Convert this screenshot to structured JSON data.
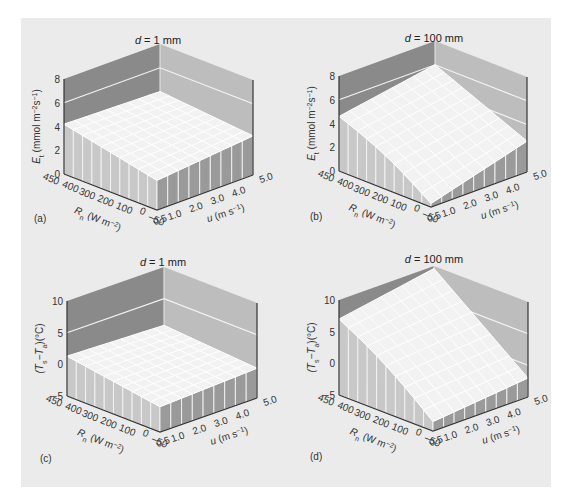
{
  "chart_data": [
    {
      "id": "a",
      "type": "surface3d",
      "panel_label": "(a)",
      "title": "d = 1 mm",
      "title_var": "d",
      "title_rest": " = 1 mm",
      "zlabel": "E_t (mmol m^-2 s^-1)",
      "zlabel_main": "E",
      "zlabel_sub": "t",
      "zlabel_rest": " (mmol m",
      "zlabel_sup1": "−2",
      "zlabel_mid": "s",
      "zlabel_sup2": "−1",
      "zlabel_end": ")",
      "xlabel": "R_n (W m^-2)",
      "ylabel": "u (m s^-1)",
      "zlim": [
        0,
        8
      ],
      "zticks": [
        "0",
        "2",
        "4",
        "6",
        "8"
      ],
      "zgrid_on_walls": [
        6
      ],
      "R_ticks": [
        "450",
        "400",
        "300",
        "200",
        "100",
        "0",
        "−50"
      ],
      "u_ticks": [
        "0.5",
        "1.0",
        "2.0",
        "3.0",
        "4.0",
        "5.0"
      ],
      "corner_values": {
        "R450_u0.5": 4.2,
        "Rneg50_u0.5": 2.5,
        "Rneg50_u5": 3.3,
        "R450_u5": 4.0
      }
    },
    {
      "id": "b",
      "type": "surface3d",
      "panel_label": "(b)",
      "title": "d = 100 mm",
      "title_var": "d",
      "title_rest": " = 100 mm",
      "zlabel": "E_t (mmol m^-2 s^-1)",
      "zlabel_main": "E",
      "zlabel_sub": "t",
      "zlabel_rest": " (mmol m",
      "zlabel_sup1": "−2",
      "zlabel_mid": "s",
      "zlabel_sup2": "−1",
      "zlabel_end": ")",
      "xlabel": "R_n (W m^-2)",
      "ylabel": "u (m s^-1)",
      "zlim": [
        0,
        8
      ],
      "zticks": [
        "0",
        "2",
        "4",
        "6",
        "8"
      ],
      "zgrid_on_walls": [
        6,
        4
      ],
      "R_ticks": [
        "450",
        "400",
        "300",
        "200",
        "100",
        "0",
        "−50"
      ],
      "u_ticks": [
        "0.5",
        "1.0",
        "2.0",
        "3.0",
        "4.0",
        "5.0"
      ],
      "corner_values": {
        "R450_u0.5": 4.6,
        "Rneg50_u0.5": 0.3,
        "Rneg50_u5": 2.6,
        "R450_u5": 6.0
      }
    },
    {
      "id": "c",
      "type": "surface3d",
      "panel_label": "(c)",
      "title": "d = 1 mm",
      "title_var": "d",
      "title_rest": " = 1 mm",
      "zlabel": "(T_s − T_a) (°C)",
      "zlabel_main": "(T",
      "zlabel_sub": "s",
      "zlabel_rest": "−T",
      "zlabel_sup1": "",
      "zlabel_mid": "",
      "zlabel_sub2": "a",
      "zlabel_end": ")(°C)",
      "xlabel": "R_n (W m^-2)",
      "ylabel": "u (m s^-1)",
      "zlim": [
        -5,
        10
      ],
      "zticks": [
        "−5",
        "0",
        "5",
        "10"
      ],
      "zgrid_on_walls": [
        5
      ],
      "R_ticks": [
        "450",
        "400",
        "300",
        "200",
        "100",
        "0",
        "−50"
      ],
      "u_ticks": [
        "0.5",
        "1.0",
        "2.0",
        "3.0",
        "4.0",
        "5.0"
      ],
      "corner_values": {
        "R450_u0.5": 1.3,
        "Rneg50_u0.5": -1.0,
        "Rneg50_u5": -0.3,
        "R450_u5": 0.8
      }
    },
    {
      "id": "d",
      "type": "surface3d",
      "panel_label": "(d)",
      "title": "d = 100 mm",
      "title_var": "d",
      "title_rest": " = 100 mm",
      "zlabel": "(T_s − T_a) (°C)",
      "zlabel_main": "(T",
      "zlabel_sub": "s",
      "zlabel_rest": "−T",
      "zlabel_sup1": "",
      "zlabel_mid": "",
      "zlabel_sub2": "a",
      "zlabel_end": ")(°C)",
      "xlabel": "R_n (W m^-2)",
      "ylabel": "u (m s^-1)",
      "zlim": [
        -5,
        10
      ],
      "zticks": [
        "−5",
        "0",
        "5",
        "10"
      ],
      "zgrid_on_walls": [
        5,
        0
      ],
      "R_ticks": [
        "450",
        "400",
        "300",
        "200",
        "100",
        "0",
        "−50"
      ],
      "u_ticks": [
        "0.5",
        "1.0",
        "2.0",
        "3.0",
        "4.0",
        "5.0"
      ],
      "corner_values": {
        "R450_u0.5": 7.0,
        "Rneg50_u0.5": -3.5,
        "Rneg50_u5": -2.0,
        "R450_u5": 9.6
      }
    }
  ],
  "axis_text": {
    "R_label_main": "R",
    "R_label_sub": "n",
    "R_label_rest": " (W m",
    "R_label_sup": "−2",
    "R_label_end": ")",
    "u_label_main": "u",
    "u_label_rest": " (m s",
    "u_label_sup": "−1",
    "u_label_end": ")"
  },
  "colors": {
    "background": "#ebebeb",
    "left_wall": "#8a8a8a",
    "right_wall": "#bdbdbd",
    "surface_top": "#f2f2f2",
    "surface_grid": "#ffffff",
    "front_left_side": "#c8c8c8",
    "front_right_side": "#9a9a9a",
    "axis_line": "#333333"
  }
}
